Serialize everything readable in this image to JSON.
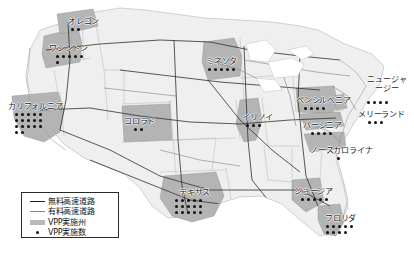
{
  "figure": {
    "type": "choropleth-dot-map",
    "region": "United States"
  },
  "legend": {
    "items": [
      {
        "key": "free-highway-line",
        "icon": "solid-line-dark",
        "label": "無料高速道路"
      },
      {
        "key": "toll-highway-line",
        "icon": "solid-line-gray",
        "label": "有料高速道路"
      },
      {
        "key": "vpp-state-swatch",
        "icon": "gray-fill-swatch",
        "label": "VPP実施州"
      },
      {
        "key": "vpp-count-dot",
        "icon": "black-dot",
        "label": "VPP実施数"
      }
    ]
  },
  "states": [
    {
      "id": "oregon",
      "label": "オレゴン",
      "label_x": 68,
      "label_y": 17,
      "dots": 2,
      "dots_x": 70,
      "dots_y": 27,
      "per_row": 2
    },
    {
      "id": "washington",
      "label": "ワシントン",
      "label_x": 49,
      "label_y": 44,
      "dots": 6,
      "dots_x": 55,
      "dots_y": 54,
      "per_row": 5
    },
    {
      "id": "california",
      "label": "カリフォルニア",
      "label_x": 8,
      "label_y": 102,
      "dots": 17,
      "dots_x": 14,
      "dots_y": 112,
      "per_row": 5
    },
    {
      "id": "colorado",
      "label": "コロラド",
      "label_x": 124,
      "label_y": 117,
      "dots": 2,
      "dots_x": 133,
      "dots_y": 127,
      "per_row": 2
    },
    {
      "id": "minnesota",
      "label": "ミネソタ",
      "label_x": 206,
      "label_y": 57,
      "dots": 5,
      "dots_x": 207,
      "dots_y": 67,
      "per_row": 5
    },
    {
      "id": "illinois",
      "label": "イリノイ",
      "label_x": 242,
      "label_y": 113,
      "dots": 3,
      "dots_x": 245,
      "dots_y": 123,
      "per_row": 3
    },
    {
      "id": "pennsylvania",
      "label": "ペンシルベニア",
      "label_x": 296,
      "label_y": 96,
      "dots": 4,
      "dots_x": 303,
      "dots_y": 106,
      "per_row": 4
    },
    {
      "id": "new-jersey",
      "label": "ニュージャージー",
      "label_x": 364,
      "label_y": 83,
      "dots": 4,
      "dots_x": 366,
      "dots_y": 100,
      "per_row": 4
    },
    {
      "id": "maryland",
      "label": "メリーランド",
      "label_x": 360,
      "label_y": 110,
      "dots": 3,
      "dots_x": 367,
      "dots_y": 120,
      "per_row": 3
    },
    {
      "id": "virginia",
      "label": "バージニア",
      "label_x": 305,
      "label_y": 121,
      "dots": 4,
      "dots_x": 310,
      "dots_y": 131,
      "per_row": 4
    },
    {
      "id": "north-carolina",
      "label": "ノースカロライナ",
      "label_x": 314,
      "label_y": 146,
      "dots": 1,
      "dots_x": 336,
      "dots_y": 156,
      "per_row": 1
    },
    {
      "id": "texas",
      "label": "テキサス",
      "label_x": 179,
      "label_y": 188,
      "dots": 15,
      "dots_x": 174,
      "dots_y": 198,
      "per_row": 5
    },
    {
      "id": "georgia",
      "label": "ジョージア",
      "label_x": 296,
      "label_y": 187,
      "dots": 5,
      "dots_x": 300,
      "dots_y": 197,
      "per_row": 5
    },
    {
      "id": "florida",
      "label": "フロリダ",
      "label_x": 325,
      "label_y": 214,
      "dots": 9,
      "dots_x": 325,
      "dots_y": 224,
      "per_row": 5
    }
  ],
  "colors": {
    "vpp_state_fill": "#b4b4b4",
    "plain_state_fill": "#efefef",
    "state_border": "#9a9a9a",
    "free_highway": "#3a3a3a",
    "toll_highway": "#8a8a8a",
    "dot": "#111111",
    "legend_border": "#2a2a2a"
  }
}
